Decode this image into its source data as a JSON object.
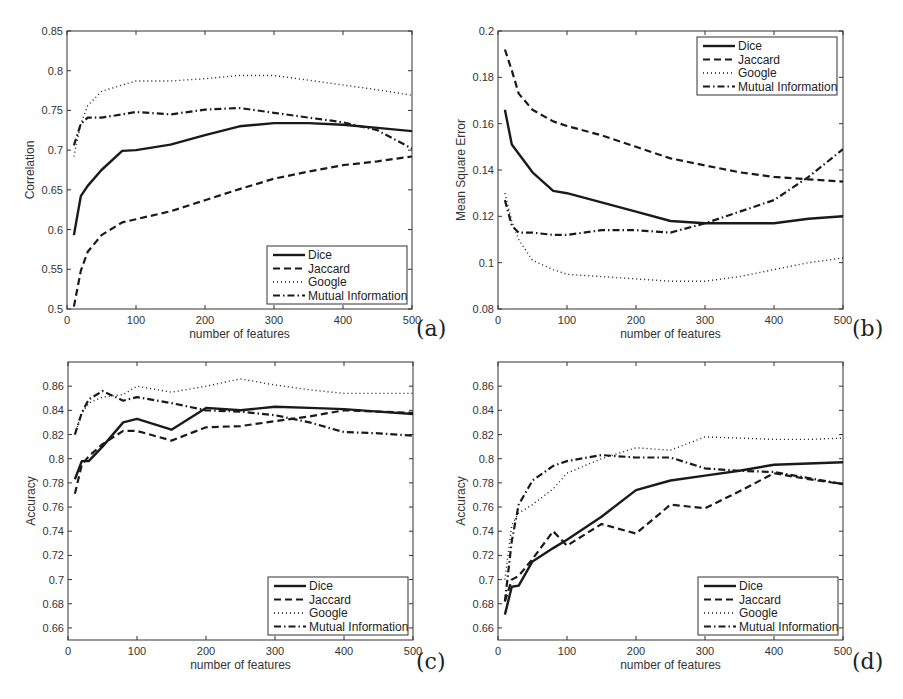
{
  "figure": {
    "x_ticks": [
      0,
      100,
      200,
      300,
      400,
      500
    ],
    "legend": [
      "Dice",
      "Jaccard",
      "Google",
      "Mutual Information"
    ],
    "line_color": "#1a1a1a"
  },
  "chart_data": [
    {
      "panel": "(a)",
      "type": "line",
      "title": "",
      "xlabel": "number of features",
      "ylabel": "Correlation",
      "xlim": [
        0,
        500
      ],
      "ylim": [
        0.5,
        0.85
      ],
      "yticks": [
        0.5,
        0.55,
        0.6,
        0.65,
        0.7,
        0.75,
        0.8,
        0.85
      ],
      "ytick_labels": [
        "0.5",
        "0.55",
        "0.6",
        "0.65",
        "0.7",
        "0.75",
        "0.8",
        "0.85"
      ],
      "legend_position": "lower right",
      "grid": false,
      "x": [
        10,
        20,
        30,
        50,
        80,
        100,
        150,
        200,
        250,
        300,
        350,
        400,
        450,
        500
      ],
      "series": [
        {
          "name": "Dice",
          "style": "solid",
          "values": [
            0.593,
            0.642,
            0.655,
            0.675,
            0.699,
            0.7,
            0.707,
            0.719,
            0.73,
            0.734,
            0.734,
            0.732,
            0.728,
            0.724
          ]
        },
        {
          "name": "Jaccard",
          "style": "dashed",
          "values": [
            0.503,
            0.548,
            0.572,
            0.593,
            0.609,
            0.613,
            0.623,
            0.637,
            0.651,
            0.664,
            0.673,
            0.681,
            0.686,
            0.692
          ]
        },
        {
          "name": "Google",
          "style": "dotted",
          "values": [
            0.692,
            0.733,
            0.756,
            0.774,
            0.782,
            0.787,
            0.787,
            0.79,
            0.794,
            0.794,
            0.788,
            0.782,
            0.776,
            0.769
          ]
        },
        {
          "name": "Mutual Information",
          "style": "dashdot",
          "values": [
            0.706,
            0.733,
            0.741,
            0.741,
            0.745,
            0.748,
            0.745,
            0.751,
            0.753,
            0.747,
            0.741,
            0.735,
            0.725,
            0.702
          ]
        }
      ]
    },
    {
      "panel": "(b)",
      "type": "line",
      "title": "",
      "xlabel": "number of features",
      "ylabel": "Mean Square Error",
      "xlim": [
        0,
        500
      ],
      "ylim": [
        0.08,
        0.2
      ],
      "yticks": [
        0.08,
        0.1,
        0.12,
        0.14,
        0.16,
        0.18,
        0.2
      ],
      "ytick_labels": [
        "0.08",
        "0.1",
        "0.12",
        "0.14",
        "0.16",
        "0.18",
        "0.2"
      ],
      "legend_position": "upper right",
      "grid": false,
      "x": [
        10,
        20,
        30,
        50,
        80,
        100,
        150,
        200,
        250,
        300,
        350,
        400,
        450,
        500
      ],
      "series": [
        {
          "name": "Dice",
          "style": "solid",
          "values": [
            0.166,
            0.151,
            0.147,
            0.139,
            0.131,
            0.13,
            0.126,
            0.122,
            0.118,
            0.117,
            0.117,
            0.117,
            0.119,
            0.12
          ]
        },
        {
          "name": "Jaccard",
          "style": "dashed",
          "values": [
            0.192,
            0.183,
            0.173,
            0.166,
            0.161,
            0.159,
            0.155,
            0.15,
            0.145,
            0.142,
            0.139,
            0.137,
            0.136,
            0.135
          ]
        },
        {
          "name": "Google",
          "style": "dotted",
          "values": [
            0.13,
            0.118,
            0.11,
            0.101,
            0.097,
            0.095,
            0.094,
            0.093,
            0.092,
            0.092,
            0.094,
            0.097,
            0.1,
            0.102
          ]
        },
        {
          "name": "Mutual Information",
          "style": "dashdot",
          "values": [
            0.127,
            0.116,
            0.113,
            0.113,
            0.112,
            0.112,
            0.114,
            0.114,
            0.113,
            0.117,
            0.122,
            0.127,
            0.137,
            0.149
          ]
        }
      ]
    },
    {
      "panel": "(c)",
      "type": "line",
      "title": "",
      "xlabel": "number of features",
      "ylabel": "Accuracy",
      "xlim": [
        0,
        500
      ],
      "ylim": [
        0.65,
        0.88
      ],
      "yticks": [
        0.66,
        0.68,
        0.7,
        0.72,
        0.74,
        0.76,
        0.78,
        0.8,
        0.82,
        0.84,
        0.86
      ],
      "ytick_labels": [
        "0.66",
        "0.68",
        "0.7",
        "0.72",
        "0.74",
        "0.76",
        "0.78",
        "0.8",
        "0.82",
        "0.84",
        "0.86"
      ],
      "legend_position": "lower right",
      "grid": false,
      "x": [
        10,
        20,
        30,
        50,
        80,
        100,
        150,
        200,
        250,
        300,
        350,
        400,
        450,
        500
      ],
      "series": [
        {
          "name": "Dice",
          "style": "solid",
          "values": [
            0.783,
            0.798,
            0.798,
            0.81,
            0.83,
            0.833,
            0.824,
            0.842,
            0.84,
            0.843,
            0.842,
            0.841,
            0.839,
            0.837
          ]
        },
        {
          "name": "Jaccard",
          "style": "dashed",
          "values": [
            0.771,
            0.795,
            0.802,
            0.812,
            0.823,
            0.823,
            0.815,
            0.826,
            0.827,
            0.831,
            0.835,
            0.84,
            0.839,
            0.838
          ]
        },
        {
          "name": "Google",
          "style": "dotted",
          "values": [
            0.82,
            0.838,
            0.846,
            0.851,
            0.853,
            0.86,
            0.855,
            0.86,
            0.866,
            0.861,
            0.857,
            0.854,
            0.854,
            0.854
          ]
        },
        {
          "name": "Mutual Information",
          "style": "dashdot",
          "values": [
            0.82,
            0.838,
            0.849,
            0.856,
            0.848,
            0.851,
            0.846,
            0.84,
            0.839,
            0.836,
            0.83,
            0.822,
            0.821,
            0.819
          ]
        }
      ]
    },
    {
      "panel": "(d)",
      "type": "line",
      "title": "",
      "xlabel": "number of features",
      "ylabel": "Accuracy",
      "xlim": [
        0,
        500
      ],
      "ylim": [
        0.65,
        0.88
      ],
      "yticks": [
        0.66,
        0.68,
        0.7,
        0.72,
        0.74,
        0.76,
        0.78,
        0.8,
        0.82,
        0.84,
        0.86
      ],
      "ytick_labels": [
        "0.66",
        "0.68",
        "0.7",
        "0.72",
        "0.74",
        "0.76",
        "0.78",
        "0.8",
        "0.82",
        "0.84",
        "0.86"
      ],
      "legend_position": "lower right",
      "grid": false,
      "x": [
        10,
        20,
        30,
        50,
        80,
        100,
        150,
        200,
        250,
        300,
        350,
        400,
        450,
        500
      ],
      "series": [
        {
          "name": "Dice",
          "style": "solid",
          "values": [
            0.671,
            0.694,
            0.695,
            0.715,
            0.726,
            0.733,
            0.752,
            0.774,
            0.782,
            0.786,
            0.79,
            0.795,
            0.796,
            0.797
          ]
        },
        {
          "name": "Jaccard",
          "style": "dashed",
          "values": [
            0.682,
            0.7,
            0.703,
            0.717,
            0.74,
            0.728,
            0.746,
            0.738,
            0.762,
            0.759,
            0.773,
            0.788,
            0.783,
            0.779
          ]
        },
        {
          "name": "Google",
          "style": "dotted",
          "values": [
            0.7,
            0.745,
            0.755,
            0.762,
            0.775,
            0.788,
            0.8,
            0.809,
            0.807,
            0.818,
            0.817,
            0.816,
            0.816,
            0.817
          ]
        },
        {
          "name": "Mutual Information",
          "style": "dashdot",
          "values": [
            0.682,
            0.732,
            0.762,
            0.782,
            0.794,
            0.798,
            0.803,
            0.801,
            0.801,
            0.792,
            0.79,
            0.789,
            0.784,
            0.779
          ]
        }
      ]
    }
  ]
}
